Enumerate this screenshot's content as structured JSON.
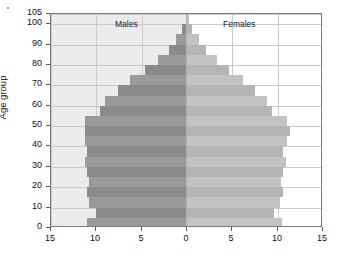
{
  "chart_data": {
    "type": "bar",
    "subtype": "population-pyramid",
    "title": "",
    "xlabel": "",
    "ylabel": "Age group",
    "xlim": [
      -15,
      15
    ],
    "ylim": [
      0,
      105
    ],
    "grid": true,
    "legend_position": "in-plot-top",
    "x_tick_values": [
      -15,
      -10,
      -5,
      0,
      5,
      10,
      15
    ],
    "x_tick_labels": [
      "15",
      "10",
      "5",
      "0",
      "5",
      "10",
      "15"
    ],
    "y_tick_values": [
      0,
      10,
      20,
      30,
      40,
      50,
      60,
      70,
      80,
      90,
      100,
      105
    ],
    "y_tick_labels": [
      "0",
      "10",
      "20",
      "30",
      "40",
      "50",
      "60",
      "70",
      "80",
      "90",
      "100",
      "105"
    ],
    "categories": [
      "0-4",
      "5-9",
      "10-14",
      "15-19",
      "20-24",
      "25-29",
      "30-34",
      "35-39",
      "40-44",
      "45-49",
      "50-54",
      "55-59",
      "60-64",
      "65-69",
      "70-74",
      "75-79",
      "80-84",
      "85-89",
      "90-94",
      "95-99",
      "100-104"
    ],
    "series": [
      {
        "name": "Males",
        "side": "left",
        "color": "#9a9a9a",
        "alt_color": "#8a8a8a",
        "values": [
          11.0,
          10.0,
          10.8,
          11.0,
          10.8,
          11.0,
          11.3,
          11.0,
          11.3,
          11.3,
          11.2,
          9.6,
          9.0,
          7.6,
          6.3,
          4.6,
          3.2,
          2.0,
          1.2,
          0.5,
          0.15
        ]
      },
      {
        "name": "Females",
        "side": "right",
        "color": "#c2c2c2",
        "alt_color": "#b4b4b4",
        "values": [
          10.5,
          9.6,
          10.3,
          10.6,
          10.4,
          10.6,
          10.9,
          10.6,
          11.0,
          11.4,
          11.0,
          9.4,
          8.8,
          7.5,
          6.2,
          4.6,
          3.3,
          2.1,
          1.3,
          0.6,
          0.2
        ]
      }
    ]
  },
  "labels": {
    "males": "Males",
    "females": "Females",
    "axis_y_title": "Age group"
  },
  "colors": {
    "plot_border": "#7b7b7b",
    "grid": "#c9c9c9",
    "male_panel_bg": "#ebebeb",
    "female_panel_bg": "#ffffff",
    "male_bar": "#9a9a9a",
    "male_bar_alt": "#8a8a8a",
    "female_bar": "#c2c2c2",
    "female_bar_alt": "#b4b4b4",
    "text": "#111111"
  }
}
